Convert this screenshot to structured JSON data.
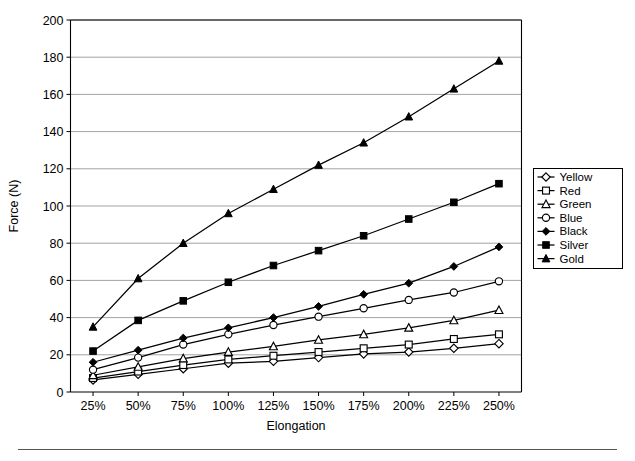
{
  "chart_data": {
    "type": "line",
    "title": "",
    "xlabel": "Elongation",
    "ylabel": "Force (N)",
    "categories": [
      "25%",
      "50%",
      "75%",
      "100%",
      "125%",
      "150%",
      "175%",
      "200%",
      "225%",
      "250%"
    ],
    "ylim": [
      0,
      200
    ],
    "yticks": [
      0,
      20,
      40,
      60,
      80,
      100,
      120,
      140,
      160,
      180,
      200
    ],
    "ytick_labels": [
      "0",
      "20",
      "40",
      "60",
      "80",
      "100",
      "120",
      "140",
      "160",
      "180",
      "200"
    ],
    "grid": "horizontal",
    "legend_position": "right",
    "series": [
      {
        "name": "Yellow",
        "marker": "open-diamond",
        "values": [
          6.5,
          9.5,
          12.5,
          15.5,
          16.5,
          18.5,
          20.5,
          21.5,
          23.5,
          26.0
        ]
      },
      {
        "name": "Red",
        "marker": "open-square",
        "values": [
          7.5,
          11.0,
          14.5,
          17.5,
          19.5,
          21.5,
          23.5,
          25.5,
          28.5,
          31.0
        ]
      },
      {
        "name": "Green",
        "marker": "open-triangle",
        "values": [
          9.0,
          13.5,
          18.0,
          21.5,
          24.5,
          28.0,
          31.0,
          34.5,
          38.5,
          44.0
        ]
      },
      {
        "name": "Blue",
        "marker": "open-circle",
        "values": [
          12.0,
          18.5,
          25.5,
          31.0,
          36.0,
          40.5,
          45.0,
          49.5,
          53.5,
          59.5
        ]
      },
      {
        "name": "Black",
        "marker": "filled-diamond",
        "values": [
          16.0,
          22.5,
          29.0,
          34.5,
          40.0,
          46.0,
          52.5,
          58.5,
          67.5,
          78.0
        ]
      },
      {
        "name": "Silver",
        "marker": "filled-square",
        "values": [
          22.0,
          38.5,
          49.0,
          59.0,
          68.0,
          76.0,
          84.0,
          93.0,
          102.0,
          112.0
        ]
      },
      {
        "name": "Gold",
        "marker": "filled-triangle",
        "values": [
          35.0,
          61.0,
          80.0,
          96.0,
          109.0,
          122.0,
          134.0,
          148.0,
          163.0,
          178.0
        ]
      }
    ]
  },
  "legend": {
    "entries": [
      "Yellow",
      "Red",
      "Green",
      "Blue",
      "Black",
      "Silver",
      "Gold"
    ]
  },
  "axes": {
    "y_title": "Force (N)",
    "x_title": "Elongation"
  }
}
